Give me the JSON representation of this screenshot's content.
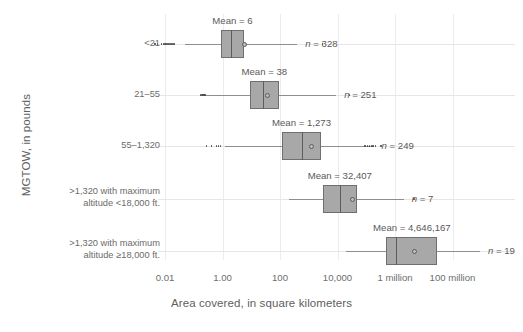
{
  "chart_data": {
    "type": "box",
    "title": "",
    "xlabel": "Area covered, in square kilometers",
    "ylabel": "MGTOW, in pounds",
    "x_scale": "log",
    "xlim": [
      0.001,
      1000000000
    ],
    "xticks": [
      0.01,
      1,
      100,
      10000,
      1000000,
      100000000
    ],
    "xticklabels": [
      "0.01",
      "1.00",
      "100",
      "10,000",
      "1 million",
      "100 million"
    ],
    "grid": "vertical",
    "legend": "none",
    "categories": [
      "<21",
      "21–55",
      "55–1,320",
      ">1,320 with maximum altitude <18,000 ft.",
      ">1,320 with maximum altitude ≥18,000 ft."
    ],
    "category_lines": [
      [
        ">1,320 with maximum",
        "altitude <18,000 ft."
      ],
      [
        ">1,320 with maximum",
        "altitude ≥18,000 ft."
      ]
    ],
    "boxes": [
      {
        "category": "<21",
        "mean_label": "Mean = 6",
        "mean": 6,
        "n_label": "n = 328",
        "n": 328,
        "whisker_low": 0.05,
        "q1": 0.9,
        "median": 2.0,
        "q3": 5.5,
        "whisker_high": 400,
        "outliers_low": [
          0.0045,
          0.0055,
          0.0075,
          0.009,
          0.01,
          0.011,
          0.012,
          0.013,
          0.015,
          0.017,
          0.019,
          0.021
        ],
        "outliers_high": [
          3000
        ]
      },
      {
        "category": "21–55",
        "mean_label": "Mean = 38",
        "mean": 38,
        "n_label": "n = 251",
        "n": 251,
        "whisker_low": 0.22,
        "q1": 9,
        "median": 25,
        "q3": 90,
        "whisker_high": 9000,
        "outliers_low": [
          0.17,
          0.19,
          0.21,
          0.23,
          0.25
        ],
        "outliers_high": [
          26000
        ]
      },
      {
        "category": "55–1,320",
        "mean_label": "Mean = 1,273",
        "mean": 1273,
        "n_label": "n = 249",
        "n": 249,
        "whisker_low": 1.2,
        "q1": 120,
        "median": 600,
        "q3": 2600,
        "whisker_high": 180000,
        "outliers_low": [
          0.28,
          0.42,
          0.62,
          0.72,
          0.85
        ],
        "outliers_high": [
          90000,
          110000,
          130000,
          150000,
          170000,
          210000,
          320000
        ]
      },
      {
        "category": ">1,320 with maximum altitude <18,000 ft.",
        "mean_label": "Mean = 32,407",
        "mean": 32407,
        "n_label": "n = 7",
        "n": 7,
        "whisker_low": 200,
        "q1": 3000,
        "median": 12000,
        "q3": 48000,
        "whisker_high": 2000000,
        "outliers_low": [],
        "outliers_high": [
          4500000
        ]
      },
      {
        "category": ">1,320 with maximum altitude ≥18,000 ft.",
        "mean_label": "Mean = 4,646,167",
        "mean": 4646167,
        "n_label": "n = 19",
        "n": 19,
        "whisker_low": 20000,
        "q1": 500000,
        "median": 1100000,
        "q3": 30000000,
        "whisker_high": 900000000,
        "outliers_low": [],
        "outliers_high": []
      }
    ]
  }
}
